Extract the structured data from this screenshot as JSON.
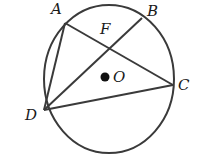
{
  "diagram": {
    "type": "circle-geometry",
    "circle": {
      "center_label": "O",
      "cx": 109,
      "cy": 79,
      "rx": 65,
      "ry": 74
    },
    "points": {
      "A": {
        "label": "A",
        "x": 65,
        "y": 23,
        "lx": 51,
        "ly": 14
      },
      "B": {
        "label": "B",
        "x": 142,
        "y": 18,
        "lx": 147,
        "ly": 16
      },
      "C": {
        "label": "C",
        "x": 173,
        "y": 85,
        "lx": 178,
        "ly": 90
      },
      "D": {
        "label": "D",
        "x": 44,
        "y": 110,
        "lx": 25,
        "ly": 120
      },
      "F": {
        "label": "F",
        "x": 109,
        "y": 48,
        "lx": 100,
        "ly": 34
      },
      "O": {
        "label": "O",
        "x": 105,
        "y": 77,
        "lx": 113,
        "ly": 82
      }
    },
    "segments": [
      "AD",
      "AC",
      "DB",
      "DC"
    ],
    "stroke_color": "#3a3a3a",
    "label_color": "#1a1a1a"
  }
}
